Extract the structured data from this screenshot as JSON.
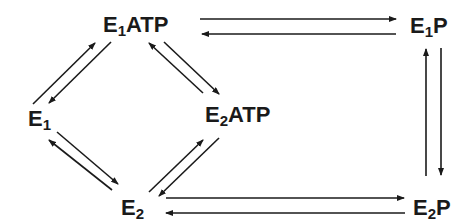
{
  "diagram": {
    "type": "reaction-cycle",
    "nodes": {
      "e1atp": {
        "base": "E",
        "sub": "1",
        "suffix": "ATP"
      },
      "e1p": {
        "base": "E",
        "sub": "1",
        "suffix": "P"
      },
      "e1": {
        "base": "E",
        "sub": "1",
        "suffix": ""
      },
      "e2atp": {
        "base": "E",
        "sub": "2",
        "suffix": "ATP"
      },
      "e2": {
        "base": "E",
        "sub": "2",
        "suffix": ""
      },
      "e2p": {
        "base": "E",
        "sub": "2",
        "suffix": "P"
      }
    },
    "edges": [
      {
        "from": "E1ATP",
        "to": "E1P",
        "reversible": true
      },
      {
        "from": "E1P",
        "to": "E2P",
        "reversible": true
      },
      {
        "from": "E2P",
        "to": "E2",
        "reversible": true
      },
      {
        "from": "E1",
        "to": "E1ATP",
        "reversible": true
      },
      {
        "from": "E1ATP",
        "to": "E2ATP",
        "reversible": true
      },
      {
        "from": "E1",
        "to": "E2",
        "reversible": true
      },
      {
        "from": "E2",
        "to": "E2ATP",
        "reversible": true
      }
    ],
    "colors": {
      "ink": "#1a1a1a",
      "background": "#ffffff"
    }
  }
}
